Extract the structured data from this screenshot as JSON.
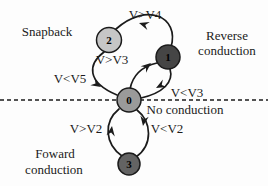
{
  "figure": {
    "background": "#fdfdfd",
    "line_color": "#1b1b1b"
  },
  "regions": {
    "snapback": "Snapback",
    "reverse": [
      "Reverse",
      "conduction"
    ],
    "no_conduction": "No conduction",
    "forward": [
      "Foward",
      "conduction"
    ]
  },
  "nodes": {
    "n0": {
      "label": "0",
      "fill": "#9a9a9a"
    },
    "n1": {
      "label": "1",
      "fill": "#454545"
    },
    "n2": {
      "label": "2",
      "fill": "#c6c6c6"
    },
    "n3": {
      "label": "3",
      "fill": "#636363"
    }
  },
  "edges": {
    "n1_to_n2": {
      "label": "V>V4"
    },
    "n0_to_n1": {
      "label": "V>V3"
    },
    "n2_to_n0": {
      "label": "V<V5"
    },
    "n1_to_n0": {
      "label": "V<V3"
    },
    "n3_to_n0": {
      "label": "V>V2"
    },
    "n0_to_n3": {
      "label": "V<V2"
    }
  }
}
